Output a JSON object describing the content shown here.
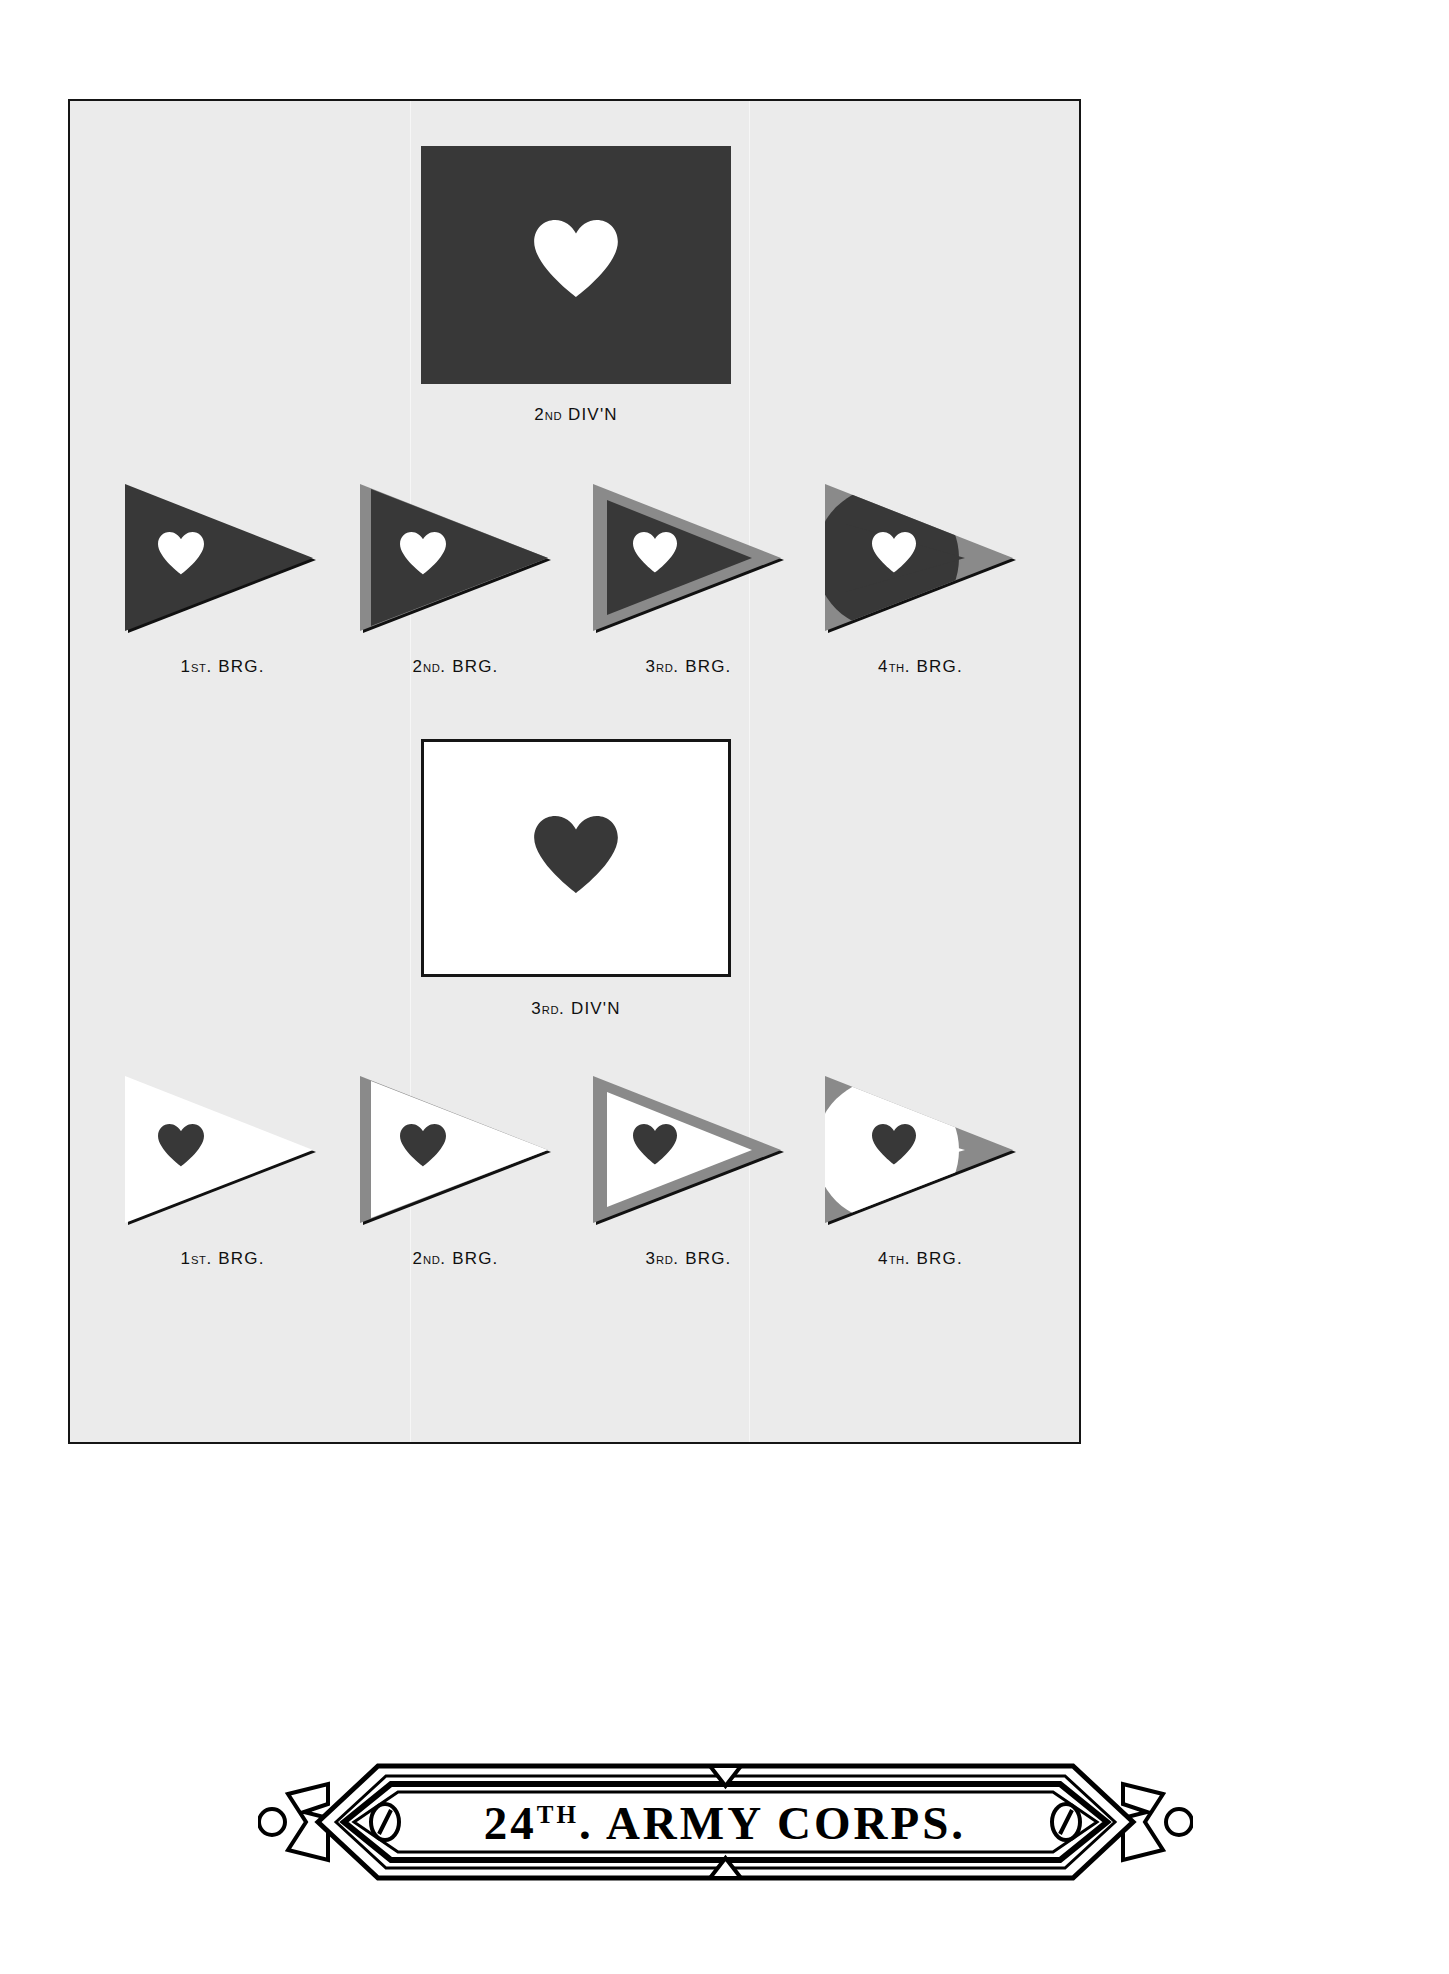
{
  "plate": {
    "background_color": "#ebebeb",
    "border_color": "#151515"
  },
  "colors": {
    "dark": "#383838",
    "gray": "#8a8a8a",
    "white": "#ffffff",
    "outline": "#151515"
  },
  "divisions": [
    {
      "id": "second-division",
      "caption_main": "2",
      "caption_ord": "ND",
      "caption_rest": " DIV'N",
      "caption_full": "2ND. DIV'N",
      "flag_style": "dark",
      "flag_field": "#383838",
      "heart_color": "#ffffff",
      "brigades": [
        {
          "label_main": "1",
          "label_ord": "ST",
          "label_rest": ". BRG.",
          "label_full": "1ST. BRG.",
          "field": "#383838",
          "heart": "#ffffff",
          "trim": "none"
        },
        {
          "label_main": "2",
          "label_ord": "ND",
          "label_rest": ". BRG.",
          "label_full": "2ND. BRG.",
          "field": "#383838",
          "heart": "#ffffff",
          "trim": "hoist-stripe"
        },
        {
          "label_main": "3",
          "label_ord": "RD",
          "label_rest": ". BRG.",
          "label_full": "3RD. BRG.",
          "field": "#383838",
          "heart": "#ffffff",
          "trim": "border"
        },
        {
          "label_main": "4",
          "label_ord": "TH",
          "label_rest": ". BRG.",
          "label_full": "4TH. BRG.",
          "field": "#383838",
          "heart": "#ffffff",
          "trim": "corners"
        }
      ]
    },
    {
      "id": "third-division",
      "caption_main": "3",
      "caption_ord": "RD",
      "caption_rest": ". DIV'N",
      "caption_full": "3RD. DIV'N",
      "flag_style": "light",
      "flag_field": "#ffffff",
      "heart_color": "#383838",
      "brigades": [
        {
          "label_main": "1",
          "label_ord": "ST",
          "label_rest": ". BRG.",
          "label_full": "1ST. BRG.",
          "field": "#ffffff",
          "heart": "#383838",
          "trim": "none"
        },
        {
          "label_main": "2",
          "label_ord": "ND",
          "label_rest": ". BRG.",
          "label_full": "2ND. BRG.",
          "field": "#ffffff",
          "heart": "#383838",
          "trim": "hoist-stripe"
        },
        {
          "label_main": "3",
          "label_ord": "RD",
          "label_rest": ". BRG.",
          "label_full": "3RD. BRG.",
          "field": "#ffffff",
          "heart": "#383838",
          "trim": "border"
        },
        {
          "label_main": "4",
          "label_ord": "TH",
          "label_rest": ". BRG.",
          "label_full": "4TH. BRG.",
          "field": "#ffffff",
          "heart": "#383838",
          "trim": "corners"
        }
      ]
    }
  ],
  "banner": {
    "number": "24",
    "ordinal": "TH",
    "ordinal_period": ".",
    "words": " ARMY CORPS.",
    "full_text": "24TH. ARMY CORPS."
  }
}
